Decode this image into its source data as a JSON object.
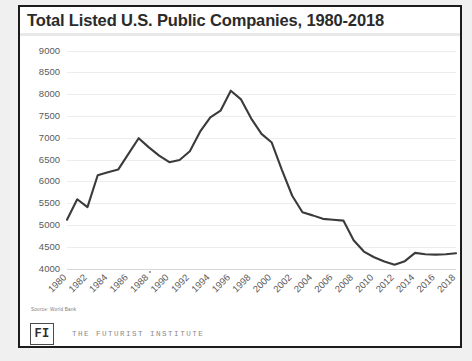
{
  "slide": {
    "title": "Total Listed U.S. Public Companies, 1980-2018",
    "source_note": "Source:  World Bank",
    "logo_mark": "FI",
    "brand_name": "THE FUTURIST INSTITUTE",
    "border_color": "#1c1c1c",
    "background_color": "#ffffff",
    "outer_background_color": "#f0f0f0"
  },
  "chart_data": {
    "type": "line",
    "title": "Total Listed U.S. Public Companies, 1980-2018",
    "xlabel": "",
    "ylabel": "",
    "ylim": [
      4000,
      9000
    ],
    "ytick_step": 500,
    "ytick_labels": [
      "9000",
      "8500",
      "8000",
      "7500",
      "7000",
      "6500",
      "6000",
      "5500",
      "5000",
      "4500",
      "4000"
    ],
    "ytick_values": [
      9000,
      8500,
      8000,
      7500,
      7000,
      6500,
      6000,
      5500,
      5000,
      4500,
      4000
    ],
    "xlim": [
      1980,
      2018
    ],
    "xtick_labels": [
      "1980",
      "1982",
      "1984",
      "1986",
      "1988",
      "1990",
      "1992",
      "1994",
      "1996",
      "1998",
      "2000",
      "2002",
      "2004",
      "2006",
      "2008",
      "2010",
      "2012",
      "2014",
      "2016",
      "2018"
    ],
    "xtick_values": [
      1980,
      1982,
      1984,
      1986,
      1988,
      1990,
      1992,
      1994,
      1996,
      1998,
      2000,
      2002,
      2004,
      2006,
      2008,
      2010,
      2012,
      2014,
      2016,
      2018
    ],
    "grid": "horizontal",
    "legend": "none",
    "line_color": "#3b3b3b",
    "grid_color": "#ededed",
    "x": [
      1980,
      1981,
      1982,
      1983,
      1984,
      1985,
      1986,
      1987,
      1988,
      1989,
      1990,
      1991,
      1992,
      1993,
      1994,
      1995,
      1996,
      1997,
      1998,
      1999,
      2000,
      2001,
      2002,
      2003,
      2004,
      2005,
      2006,
      2007,
      2008,
      2009,
      2010,
      2011,
      2012,
      2013,
      2014,
      2015,
      2016,
      2017,
      2018
    ],
    "series": [
      {
        "name": "Total Listed U.S. Public Companies",
        "values": [
          5130,
          5600,
          5420,
          6150,
          6220,
          6280,
          6640,
          7000,
          6790,
          6600,
          6450,
          6500,
          6700,
          7150,
          7480,
          7630,
          8090,
          7890,
          7450,
          7100,
          6900,
          6270,
          5680,
          5300,
          5230,
          5150,
          5130,
          5110,
          4660,
          4400,
          4270,
          4170,
          4100,
          4180,
          4370,
          4340,
          4330,
          4340,
          4360
        ]
      }
    ],
    "annotations": [
      {
        "label": "peak",
        "x": 1996,
        "y": 8090
      },
      {
        "label": "trough",
        "x": 2012,
        "y": 4100
      }
    ]
  }
}
